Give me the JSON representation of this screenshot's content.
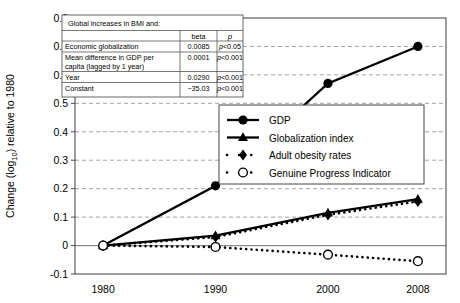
{
  "axes": {
    "ylabel": "Change (log",
    "ylabel_sub": "10",
    "ylabel_end": ") relative to 1980",
    "ytick_labels": [
      "0.8",
      "0.7",
      "0.6",
      "0.5",
      "0.4",
      "0.3",
      "0.2",
      "0.1",
      "0",
      "-0.1"
    ],
    "xtick_labels": [
      "1980",
      "1990",
      "2000",
      "2008"
    ]
  },
  "table": {
    "caption": "Global increases in BMI and:",
    "columns": [
      "",
      "beta",
      "p"
    ],
    "rows": [
      {
        "label": "Economic globalization",
        "beta": "0.0085",
        "p": "p<0.05"
      },
      {
        "label": "Mean difference in GDP per capita (lagged by 1 year)",
        "beta": "0.0001",
        "p": "p<0.001"
      },
      {
        "label": "Year",
        "beta": "0.0290",
        "p": "p<0.001"
      },
      {
        "label": "Constant",
        "beta": "−35.03",
        "p": "p<0.001"
      }
    ]
  },
  "legend": {
    "items": [
      {
        "label": "GDP",
        "marker": "filled-circle-marker",
        "line": "solid"
      },
      {
        "label": "Globalization index",
        "marker": "filled-triangle-marker",
        "line": "solid"
      },
      {
        "label": "Adult obesity rates",
        "marker": "filled-diamond-marker",
        "line": "dotted"
      },
      {
        "label": "Genuine Progress Indicator",
        "marker": "open-circle-marker",
        "line": "dotted"
      }
    ]
  },
  "chart_data": {
    "type": "line",
    "title": "",
    "xlabel": "",
    "ylabel": "Change (log10) relative to 1980",
    "x": [
      1980,
      1990,
      2000,
      2008
    ],
    "xlim": [
      1977.5,
      2010.5
    ],
    "ylim": [
      -0.1,
      0.8
    ],
    "grid": true,
    "legend_position": "middle-right",
    "series": [
      {
        "name": "GDP",
        "marker": "filled-circle",
        "line": "solid",
        "values": [
          0.0,
          0.21,
          0.57,
          0.7
        ]
      },
      {
        "name": "Globalization index",
        "marker": "filled-triangle",
        "line": "solid",
        "values": [
          0.0,
          0.035,
          0.115,
          0.163
        ]
      },
      {
        "name": "Adult obesity rates",
        "marker": "filled-diamond",
        "line": "dotted",
        "values": [
          0.0,
          0.03,
          0.108,
          0.155
        ]
      },
      {
        "name": "Genuine Progress Indicator",
        "marker": "open-circle",
        "line": "dotted",
        "values": [
          0.0,
          -0.005,
          -0.032,
          -0.055
        ]
      }
    ]
  }
}
